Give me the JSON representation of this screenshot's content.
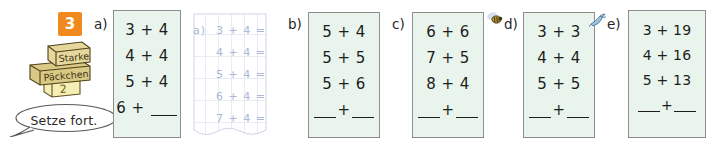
{
  "exercise": {
    "number": "3",
    "logo_lines": [
      "Starke",
      "Päckchen",
      "2"
    ],
    "instruction": "Setze fort."
  },
  "parts": [
    {
      "id": "a",
      "label": "a)",
      "marker": null,
      "rows": [
        "3 + 4",
        "4 + 4",
        "5 + 4"
      ],
      "open_row": "6 + ",
      "open_row_kind": "one-blank"
    },
    {
      "id": "b",
      "label": "b)",
      "marker": null,
      "rows": [
        "5 + 4",
        "5 + 5",
        "5 + 6"
      ],
      "open_row": "+",
      "open_row_kind": "two-blanks"
    },
    {
      "id": "c",
      "label": "c)",
      "marker": null,
      "rows": [
        "6 + 6",
        "7 + 5",
        "8 + 4"
      ],
      "open_row": "+",
      "open_row_kind": "two-blanks"
    },
    {
      "id": "d",
      "label": "d)",
      "marker": "bee-icon",
      "rows": [
        "3 + 3",
        "4 + 4",
        "5 + 5"
      ],
      "open_row": "+",
      "open_row_kind": "two-blanks"
    },
    {
      "id": "e",
      "label": "e)",
      "marker": "bird-icon",
      "rows": [
        "3 + 19",
        "4 + 16",
        "5 + 13"
      ],
      "open_row": "+",
      "open_row_kind": "two-blanks"
    }
  ],
  "grid_paper": {
    "label": "a)",
    "rows": [
      "3 + 4 =",
      "4 + 4 =",
      "5 + 4 =",
      "6 + 4 =",
      "7 + 4 ="
    ]
  },
  "colors": {
    "badge": "#f08a1e",
    "card_bg": "#e9f4ec",
    "card_border": "#8d8d8d",
    "grid_ink": "#aab8d6",
    "text": "#1d1d1d"
  }
}
